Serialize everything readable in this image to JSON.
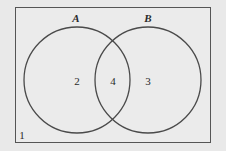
{
  "diagram": {
    "type": "venn",
    "sets": [
      {
        "name": "A",
        "label": "A",
        "only_value": "2"
      },
      {
        "name": "B",
        "label": "B",
        "only_value": "3"
      }
    ],
    "intersection_value": "4",
    "outside_value": "1",
    "colors": {
      "background": "#e9e9e9",
      "stroke": "#4a4a4a"
    }
  }
}
